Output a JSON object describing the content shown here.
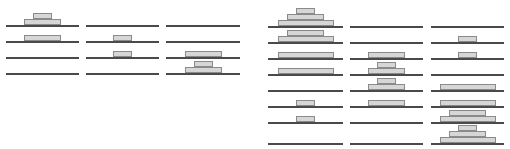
{
  "diagram": {
    "colors": {
      "line": "#4a4a4a",
      "disk_fill": "#d6d6d6",
      "disk_border": "#8a8a8a"
    },
    "disk_height": 6,
    "puzzles": [
      {
        "name": "two-disk",
        "disks": {
          "L": {
            "w": 37
          },
          "S": {
            "w": 19
          }
        },
        "pegs": [
          {
            "x": 6,
            "w": 73
          },
          {
            "x": 86,
            "w": 73
          },
          {
            "x": 166,
            "w": 74
          }
        ],
        "row_y": [
          25,
          41,
          57,
          73
        ],
        "states": [
          [
            [
              "L",
              "S"
            ],
            [],
            []
          ],
          [
            [
              "L"
            ],
            [
              "S"
            ],
            []
          ],
          [
            [],
            [
              "S"
            ],
            [
              "L"
            ]
          ],
          [
            [],
            [],
            [
              "L",
              "S"
            ]
          ]
        ]
      },
      {
        "name": "three-disk",
        "disks": {
          "L": {
            "w": 56
          },
          "M": {
            "w": 37
          },
          "S": {
            "w": 19
          }
        },
        "pegs": [
          {
            "x": 268,
            "w": 75
          },
          {
            "x": 350,
            "w": 73
          },
          {
            "x": 431,
            "w": 73
          }
        ],
        "row_y": [
          26,
          42,
          58,
          74,
          90,
          106,
          122,
          143
        ],
        "states": [
          [
            [
              "L",
              "M",
              "S"
            ],
            [],
            []
          ],
          [
            [
              "L",
              "M"
            ],
            [],
            [
              "S"
            ]
          ],
          [
            [
              "L"
            ],
            [
              "M"
            ],
            [
              "S"
            ]
          ],
          [
            [
              "L"
            ],
            [
              "M",
              "S"
            ],
            []
          ],
          [
            [],
            [
              "M",
              "S"
            ],
            [
              "L"
            ]
          ],
          [
            [
              "S"
            ],
            [
              "M"
            ],
            [
              "L"
            ]
          ],
          [
            [
              "S"
            ],
            [],
            [
              "L",
              "M"
            ]
          ],
          [
            [],
            [],
            [
              "L",
              "M",
              "S"
            ]
          ]
        ]
      }
    ]
  }
}
